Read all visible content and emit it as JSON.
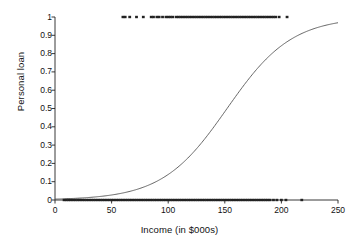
{
  "chart_data": {
    "type": "scatter",
    "title": "",
    "xlabel": "Income (in $000s)",
    "ylabel": "Personal loan",
    "xlim": [
      0,
      250
    ],
    "ylim": [
      0,
      1
    ],
    "grid": false,
    "legend": "none",
    "xticks": [
      0,
      50,
      100,
      150,
      200,
      250
    ],
    "xtick_labels": [
      "0",
      "50",
      "100",
      "150",
      "200",
      "250"
    ],
    "yticks": [
      0,
      0.1,
      0.2,
      0.3,
      0.4,
      0.5,
      0.6,
      0.7,
      0.8,
      0.9,
      1
    ],
    "ytick_labels": [
      "0",
      "0.1",
      "0.2",
      "0.3",
      "0.4",
      "0.5",
      "0.6",
      "0.7",
      "0.8",
      "0.9",
      "1"
    ],
    "series": [
      {
        "name": "Logistic fit",
        "type": "line",
        "color": "#555555",
        "model": "logistic",
        "midpoint_x": 152,
        "slope": 0.035,
        "points_x": [
          0,
          10,
          20,
          30,
          40,
          50,
          60,
          70,
          80,
          90,
          100,
          110,
          120,
          130,
          140,
          150,
          160,
          170,
          180,
          190,
          200,
          210,
          220,
          230,
          240,
          250
        ],
        "points_y": [
          0.005,
          0.007,
          0.01,
          0.014,
          0.02,
          0.028,
          0.039,
          0.055,
          0.076,
          0.105,
          0.143,
          0.193,
          0.255,
          0.329,
          0.412,
          0.5,
          0.588,
          0.671,
          0.745,
          0.807,
          0.857,
          0.895,
          0.924,
          0.945,
          0.96,
          0.972
        ]
      },
      {
        "name": "Personal loan = 1",
        "type": "scatter",
        "color": "#222222",
        "y": 1,
        "x": [
          60,
          62,
          66,
          72,
          78,
          85,
          87,
          90,
          92,
          95,
          98,
          100,
          102,
          104,
          107,
          109,
          111,
          113,
          115,
          117,
          119,
          121,
          123,
          125,
          127,
          129,
          131,
          133,
          135,
          137,
          139,
          141,
          143,
          145,
          147,
          149,
          151,
          153,
          155,
          157,
          159,
          161,
          163,
          165,
          167,
          169,
          171,
          173,
          175,
          177,
          179,
          181,
          183,
          185,
          187,
          189,
          191,
          193,
          195,
          198,
          205
        ]
      },
      {
        "name": "Personal loan = 0",
        "type": "scatter",
        "color": "#222222",
        "y": 0,
        "x": [
          8,
          10,
          12,
          14,
          16,
          18,
          20,
          22,
          24,
          26,
          28,
          30,
          32,
          34,
          36,
          38,
          40,
          42,
          44,
          46,
          48,
          50,
          52,
          54,
          56,
          58,
          60,
          62,
          64,
          66,
          68,
          70,
          72,
          74,
          76,
          78,
          80,
          82,
          84,
          86,
          88,
          90,
          92,
          94,
          96,
          98,
          100,
          102,
          104,
          106,
          108,
          110,
          112,
          114,
          116,
          118,
          120,
          122,
          124,
          126,
          128,
          130,
          132,
          134,
          136,
          138,
          140,
          142,
          144,
          146,
          148,
          150,
          152,
          154,
          156,
          158,
          160,
          162,
          164,
          166,
          168,
          170,
          172,
          174,
          176,
          178,
          180,
          182,
          184,
          186,
          188,
          190,
          193,
          196,
          200,
          204,
          218
        ]
      }
    ]
  },
  "colors": {
    "axis": "#222222",
    "curve": "#555555",
    "marker": "#222222",
    "background": "#ffffff"
  }
}
